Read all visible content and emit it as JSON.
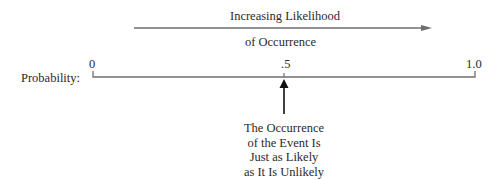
{
  "diagram": {
    "type": "probability-scale",
    "trend_arrow": {
      "label_line1": "Increasing Likelihood",
      "label_line2": "of Occurrence",
      "direction": "right"
    },
    "scale": {
      "label": "Probability:",
      "ticks": [
        {
          "value": "0",
          "position": 0
        },
        {
          "value": ".5",
          "position": 0.5
        },
        {
          "value": "1.0",
          "position": 1.0
        }
      ]
    },
    "pointer": {
      "target": ".5",
      "caption_lines": [
        "The Occurrence",
        "of the Event Is",
        "Just as Likely",
        "as It Is Unlikely"
      ]
    },
    "colors": {
      "line": "#6e6e6e",
      "text": "#2a2a2a",
      "pointer": "#111111"
    }
  }
}
